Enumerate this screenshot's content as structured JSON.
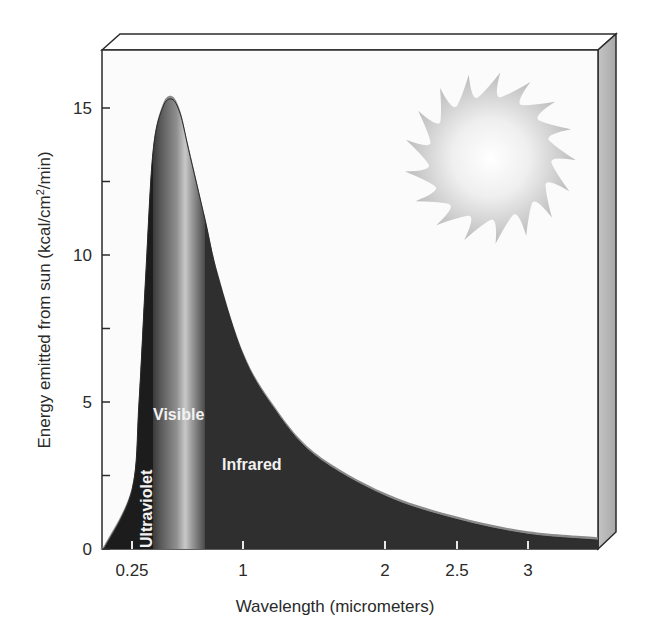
{
  "chart_data": {
    "type": "area",
    "title": "",
    "xlabel": "Wavelength (micrometers)",
    "ylabel": "Energy emitted from sun (kcal/cm²/min)",
    "ylabel_parts": {
      "before": "Energy emitted from sun (kcal/cm",
      "sup": "2",
      "after": "/min)"
    },
    "x_ticks": [
      "0.25",
      "1",
      "2",
      "2.5",
      "3"
    ],
    "y_ticks": [
      "0",
      "5",
      "10",
      "15"
    ],
    "y_minor_ticks": [
      2.5,
      7.5,
      12.5
    ],
    "ylim": [
      0,
      17
    ],
    "xlim": [
      0.2,
      3.5
    ],
    "grid": false,
    "legend": "none",
    "series": [
      {
        "name": "Solar radiation",
        "x": [
          0.2,
          0.25,
          0.3,
          0.35,
          0.4,
          0.45,
          0.5,
          0.55,
          0.6,
          0.7,
          0.8,
          1.0,
          1.2,
          1.5,
          2.0,
          2.5,
          3.0,
          3.5
        ],
        "values": [
          0,
          2.0,
          5.0,
          9.5,
          13.5,
          15.0,
          15.3,
          14.8,
          13.6,
          11.2,
          9.3,
          6.6,
          4.9,
          3.2,
          1.8,
          1.0,
          0.5,
          0.3
        ]
      }
    ],
    "regions": [
      {
        "label": "Ultraviolet",
        "x_start": 0.2,
        "x_end": 0.4,
        "orientation": "vertical"
      },
      {
        "label": "Visible",
        "x_start": 0.4,
        "x_end": 0.7,
        "orientation": "horizontal"
      },
      {
        "label": "Infrared",
        "x_start": 0.7,
        "x_end": 3.5,
        "orientation": "horizontal"
      }
    ],
    "decorations": [
      "sun-illustration",
      "3d-box-frame"
    ]
  },
  "colors": {
    "panel": "#fbfbfb",
    "frame": "#2b2b2b",
    "side_face": "#b8b8b8",
    "uv_fill": "#1c1c1c",
    "ir_fill": "#2f2f2f",
    "curve_edge": "#8a8a8a",
    "visible_band_light": "#c9c9c9",
    "visible_band_dark": "#555555",
    "sun_center": "#ffffff",
    "sun_edge": "#bdbdbd"
  }
}
